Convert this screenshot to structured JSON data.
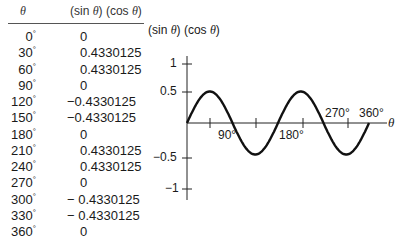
{
  "table": {
    "headers": {
      "theta": "θ",
      "value_sin": "(sin ",
      "value_theta1": "θ",
      "value_mid": ") (cos ",
      "value_theta2": "θ",
      "value_end": ")"
    },
    "rows": [
      {
        "angle": "0",
        "value": "0"
      },
      {
        "angle": "30",
        "value": "0.4330125"
      },
      {
        "angle": "60",
        "value": "0.4330125"
      },
      {
        "angle": "90",
        "value": "0"
      },
      {
        "angle": "120",
        "value": "−0.4330125"
      },
      {
        "angle": "150",
        "value": "−0.4330125"
      },
      {
        "angle": "180",
        "value": "0"
      },
      {
        "angle": "210",
        "value": "0.4330125"
      },
      {
        "angle": "240",
        "value": "0.4330125"
      },
      {
        "angle": "270",
        "value": "0"
      },
      {
        "angle": "300",
        "value": "− 0.4330125"
      },
      {
        "angle": "330",
        "value": "− 0.4330125"
      },
      {
        "angle": "360",
        "value": "0"
      }
    ],
    "degree_symbol": "°"
  },
  "graph": {
    "ylabel_parts": {
      "a": "(sin ",
      "t1": "θ",
      "b": ") (cos ",
      "t2": "θ",
      "c": ")"
    },
    "y_ticks": [
      "1",
      "0.5",
      "−0.5",
      "−1"
    ],
    "x_labels": [
      "90°",
      "180°",
      "270°",
      "360°"
    ],
    "x_axis_label": "θ"
  },
  "chart_data": {
    "type": "line",
    "title": "",
    "xlabel": "θ",
    "ylabel": "(sin θ) (cos θ)",
    "x": [
      0,
      30,
      60,
      90,
      120,
      150,
      180,
      210,
      240,
      270,
      300,
      330,
      360
    ],
    "series": [
      {
        "name": "(sin θ)(cos θ)",
        "values": [
          0,
          0.4330125,
          0.4330125,
          0,
          -0.4330125,
          -0.4330125,
          0,
          0.4330125,
          0.4330125,
          0,
          -0.4330125,
          -0.4330125,
          0
        ]
      }
    ],
    "x_tick_labels": [
      "90°",
      "180°",
      "270°",
      "360°"
    ],
    "y_tick_labels": [
      "1",
      "0.5",
      "-0.5",
      "-1"
    ],
    "xlim": [
      0,
      360
    ],
    "ylim": [
      -1,
      1
    ],
    "grid": false,
    "legend": null
  }
}
